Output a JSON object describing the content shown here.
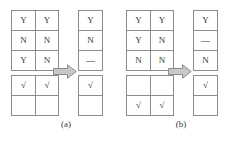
{
  "figure": {
    "background_color": "#ffffff",
    "line_color": "#8c8c8c",
    "text_color": "#3a3a3a",
    "arrow_fill_color": "#c8c8c8",
    "arrow_stroke_color": "#8c8c8c",
    "panels": [
      {
        "id": "a",
        "caption": "(a)",
        "arrow_icon": "right-block-arrow",
        "input": {
          "label_grid": {
            "rows": 3,
            "cols": 2,
            "cells": [
              [
                "Y",
                "Y"
              ],
              [
                "N",
                "N"
              ],
              [
                "Y",
                "N"
              ]
            ]
          },
          "mark_grid": {
            "rows": 2,
            "cols": 2,
            "cells": [
              [
                "√",
                "√"
              ],
              [
                "",
                ""
              ]
            ]
          }
        },
        "output": {
          "label_grid": {
            "rows": 3,
            "cols": 1,
            "cells": [
              [
                "Y"
              ],
              [
                "N"
              ],
              [
                "—"
              ]
            ]
          },
          "mark_grid": {
            "rows": 2,
            "cols": 1,
            "cells": [
              [
                "√"
              ],
              [
                ""
              ]
            ]
          }
        }
      },
      {
        "id": "b",
        "caption": "(b)",
        "arrow_icon": "right-block-arrow",
        "input": {
          "label_grid": {
            "rows": 3,
            "cols": 2,
            "cells": [
              [
                "Y",
                "Y"
              ],
              [
                "Y",
                "N"
              ],
              [
                "N",
                "N"
              ]
            ]
          },
          "mark_grid": {
            "rows": 2,
            "cols": 2,
            "cells": [
              [
                "",
                ""
              ],
              [
                "√",
                "√"
              ]
            ]
          }
        },
        "output": {
          "label_grid": {
            "rows": 3,
            "cols": 1,
            "cells": [
              [
                "Y"
              ],
              [
                "—"
              ],
              [
                "N"
              ]
            ]
          },
          "mark_grid": {
            "rows": 2,
            "cols": 1,
            "cells": [
              [
                "√"
              ],
              [
                ""
              ]
            ]
          }
        }
      }
    ]
  }
}
